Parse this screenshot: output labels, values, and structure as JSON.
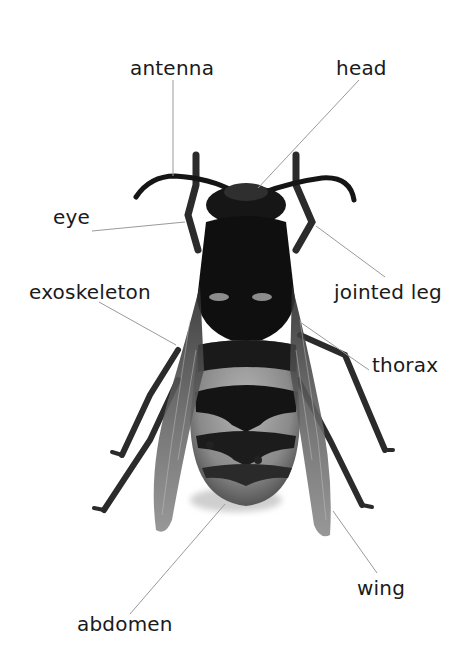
{
  "diagram": {
    "labels": [
      {
        "id": "antenna",
        "text": "antenna",
        "x": 130,
        "y": 58,
        "line": [
          173,
          80,
          173,
          176
        ]
      },
      {
        "id": "head",
        "text": "head",
        "x": 336,
        "y": 58,
        "line": [
          359,
          80,
          258,
          188
        ]
      },
      {
        "id": "eye",
        "text": "eye",
        "x": 53,
        "y": 207,
        "line": [
          92,
          231,
          185,
          222
        ]
      },
      {
        "id": "exoskeleton",
        "text": "exoskeleton",
        "x": 29,
        "y": 282,
        "line": [
          99,
          302,
          176,
          345
        ]
      },
      {
        "id": "jointed-leg",
        "text": "jointed leg",
        "x": 334,
        "y": 282,
        "line": [
          385,
          277,
          316,
          226
        ]
      },
      {
        "id": "thorax",
        "text": "thorax",
        "x": 372,
        "y": 355,
        "line": [
          369,
          370,
          300,
          322
        ]
      },
      {
        "id": "wing",
        "text": "wing",
        "x": 357,
        "y": 578,
        "line": [
          377,
          573,
          333,
          511
        ]
      },
      {
        "id": "abdomen",
        "text": "abdomen",
        "x": 77,
        "y": 614,
        "line": [
          130,
          614,
          225,
          504
        ]
      }
    ],
    "colors": {
      "background": "#ffffff",
      "text": "#1a1a1a",
      "leader_line": "#9a9a9a",
      "body_dark": "#141414",
      "body_mid": "#6e6e6e",
      "body_light": "#a9a9a9",
      "wing": "#7a7a7a"
    }
  }
}
